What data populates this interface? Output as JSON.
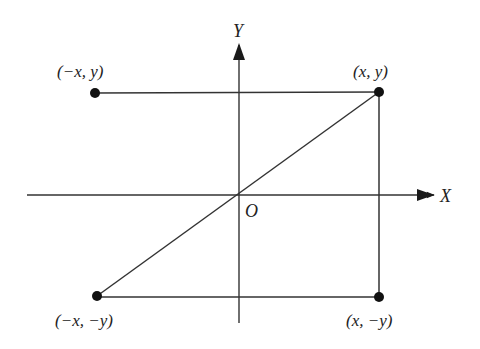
{
  "diagram": {
    "colors": {
      "line": "#2a2a2a",
      "background": "#ffffff"
    },
    "axes": {
      "x_label": "X",
      "y_label": "Y",
      "origin_label": "O"
    },
    "points": [
      {
        "id": "q1",
        "label": "(x, y)"
      },
      {
        "id": "q2",
        "label": "(−x, y)"
      },
      {
        "id": "q3",
        "label": "(−x, −y)"
      },
      {
        "id": "q4",
        "label": "(x, −y)"
      }
    ],
    "segments": [
      "(-x, y) to (x, y)",
      "(x, y) to (x, -y)",
      "(-x, -y) to (x, -y)",
      "(-x, -y) to (x, y) through O"
    ]
  }
}
